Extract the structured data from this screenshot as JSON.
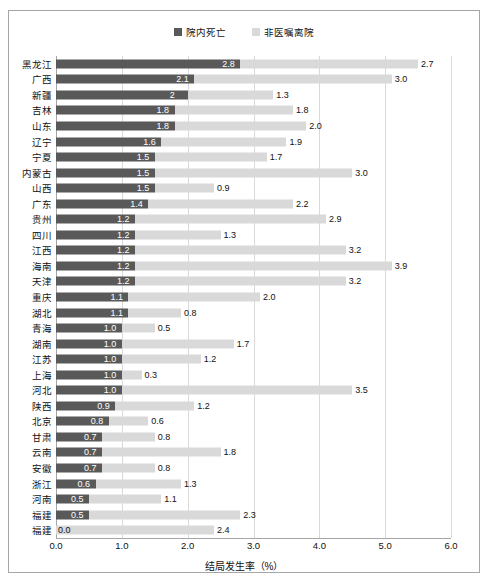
{
  "legend": {
    "items": [
      {
        "label": "院内死亡",
        "color": "#595959",
        "name": "legend-inner-death"
      },
      {
        "label": "非医嘱离院",
        "color": "#d9d9d9",
        "name": "legend-non-advised-discharge"
      }
    ]
  },
  "axis": {
    "xlabel": "结局发生率（%）",
    "xticks": [
      "0.0",
      "1.0",
      "2.0",
      "3.0",
      "4.0",
      "5.0",
      "6.0"
    ]
  },
  "chart_data": {
    "type": "bar",
    "orientation": "horizontal",
    "stacked": true,
    "title": "",
    "xlabel": "结局发生率（%）",
    "ylabel": "",
    "xlim": [
      0.0,
      6.0
    ],
    "grid": true,
    "legend_position": "top-center",
    "categories": [
      "黑龙江",
      "广西",
      "新疆",
      "吉林",
      "山东",
      "辽宁",
      "宁夏",
      "内蒙古",
      "山西",
      "广东",
      "贵州",
      "四川",
      "江西",
      "海南",
      "天津",
      "重庆",
      "湖北",
      "青海",
      "湖南",
      "江苏",
      "上海",
      "河北",
      "陕西",
      "北京",
      "甘肃",
      "云南",
      "安徽",
      "浙江",
      "河南",
      "福建",
      "福建"
    ],
    "series": [
      {
        "name": "院内死亡",
        "color": "#595959",
        "values": [
          2.8,
          2.1,
          2.0,
          1.8,
          1.8,
          1.6,
          1.5,
          1.5,
          1.5,
          1.4,
          1.2,
          1.2,
          1.2,
          1.2,
          1.2,
          1.1,
          1.1,
          1.0,
          1.0,
          1.0,
          1.0,
          1.0,
          0.9,
          0.8,
          0.7,
          0.7,
          0.7,
          0.6,
          0.5,
          0.5,
          0.0
        ],
        "labels": [
          "2.8",
          "2.1",
          "2",
          "1.8",
          "1.8",
          "1.6",
          "1.5",
          "1.5",
          "1.5",
          "1.4",
          "1.2",
          "1.2",
          "1.2",
          "1.2",
          "1.2",
          "1.1",
          "1.1",
          "1.0",
          "1.0",
          "1.0",
          "1.0",
          "1.0",
          "0.9",
          "0.8",
          "0.7",
          "0.7",
          "0.7",
          "0.6",
          "0.5",
          "0.5",
          "0.0"
        ]
      },
      {
        "name": "非医嘱离院",
        "color": "#d9d9d9",
        "values": [
          2.7,
          3.0,
          1.3,
          1.8,
          2.0,
          1.9,
          1.7,
          3.0,
          0.9,
          2.2,
          2.9,
          1.3,
          3.2,
          3.9,
          3.2,
          2.0,
          0.8,
          0.5,
          1.7,
          1.2,
          0.3,
          3.5,
          1.2,
          0.6,
          0.8,
          1.8,
          0.8,
          1.3,
          1.1,
          2.3,
          2.4
        ],
        "labels": [
          "2.7",
          "3.0",
          "1.3",
          "1.8",
          "2.0",
          "1.9",
          "1.7",
          "3.0",
          "0.9",
          "2.2",
          "2.9",
          "1.3",
          "3.2",
          "3.9",
          "3.2",
          "2.0",
          "0.8",
          "0.5",
          "1.7",
          "1.2",
          "0.3",
          "3.5",
          "1.2",
          "0.6",
          "0.8",
          "1.8",
          "0.8",
          "1.3",
          "1.1",
          "2.3",
          "2.4"
        ]
      }
    ]
  }
}
